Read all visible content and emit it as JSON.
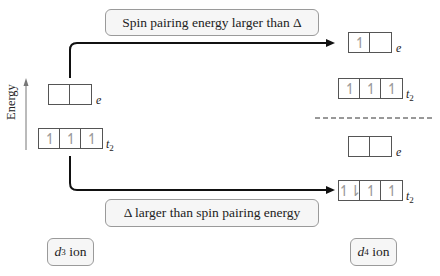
{
  "diagram": {
    "axis": {
      "label": "Energy"
    },
    "labels": {
      "top_path": "Spin pairing energy larger than Δ",
      "bottom_path": "Δ larger than spin pairing energy"
    },
    "ions": {
      "left": {
        "symbol": "d",
        "superscript": "3",
        "suffix": " ion"
      },
      "right": {
        "symbol": "d",
        "superscript": "4",
        "suffix": " ion"
      }
    },
    "orbital_sets": {
      "e_symbol": "e",
      "t2_symbol": "t",
      "t2_subscript": "2"
    },
    "left_configuration": {
      "e": [
        "",
        ""
      ],
      "t2": [
        "↿",
        "↿",
        "↿"
      ]
    },
    "right_high_spin": {
      "e": [
        "↿",
        ""
      ],
      "t2": [
        "↿",
        "↿",
        "↿"
      ]
    },
    "right_low_spin": {
      "e": [
        "",
        ""
      ],
      "t2": [
        "↿⇂",
        "↿",
        "↿"
      ]
    },
    "colors": {
      "line": "#111111",
      "box_border": "#555555",
      "electron": "#999999",
      "label_bg": "#f6f6f6",
      "label_border": "#9a9a9a"
    }
  }
}
